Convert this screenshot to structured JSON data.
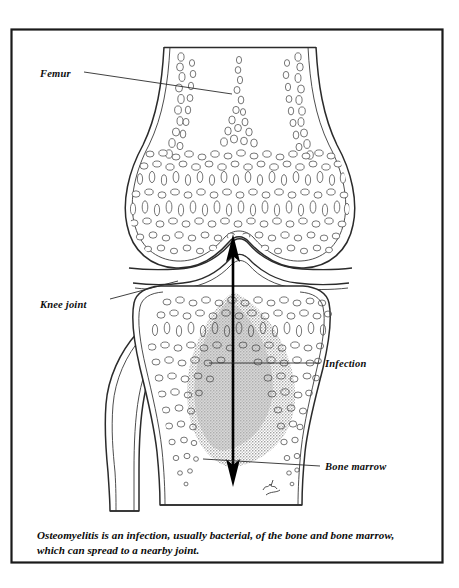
{
  "figure": {
    "frame": {
      "stroke": "#1a1a1a",
      "x": 11,
      "y": 29,
      "width": 432,
      "height": 534
    },
    "colors": {
      "ink": "#1a1a1a",
      "outline": "#2b2b2b",
      "trabecula": "#4a4a4a",
      "infection_fill": "#b5b5b5",
      "background": "#ffffff",
      "arrow": "#000000"
    },
    "labels": [
      {
        "id": "femur",
        "text": "Femur",
        "x": 40,
        "y": 77,
        "leader": "M82,73 L230,93"
      },
      {
        "id": "knee-joint",
        "text": "Knee joint",
        "x": 40,
        "y": 308,
        "leader": "M108,300 L176,283"
      },
      {
        "id": "infection",
        "text": "Infection",
        "x": 325,
        "y": 367,
        "leader": "M322,363 L212,363"
      },
      {
        "id": "bone-marrow",
        "text": "Bone marrow",
        "x": 325,
        "y": 470,
        "leader": "M322,466 L207,461"
      }
    ],
    "structures": [
      {
        "id": "femur-bone",
        "name": "femur"
      },
      {
        "id": "tibia-bone",
        "name": "tibia"
      },
      {
        "id": "fibula-bone",
        "name": "fibula"
      },
      {
        "id": "infection-region",
        "name": "infection-stipple"
      },
      {
        "id": "marrow-arrow",
        "name": "double-headed-arrow"
      },
      {
        "id": "artist-signature",
        "name": "signature"
      }
    ]
  },
  "caption": {
    "line1": "Osteomyelitis is an infection, usually bacterial, of the bone and bone marrow,",
    "line2": "which can spread to a nearby joint."
  }
}
